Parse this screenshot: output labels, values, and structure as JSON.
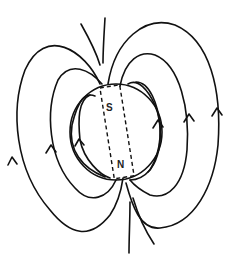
{
  "diagram": {
    "magnet": {
      "top_pole_label": "S",
      "bottom_pole_label": "N"
    },
    "field_line_direction": "upward (from N pole at bottom, around outside, into S pole at top)",
    "colors": {
      "line": "#111111",
      "background": "#ffffff"
    }
  }
}
